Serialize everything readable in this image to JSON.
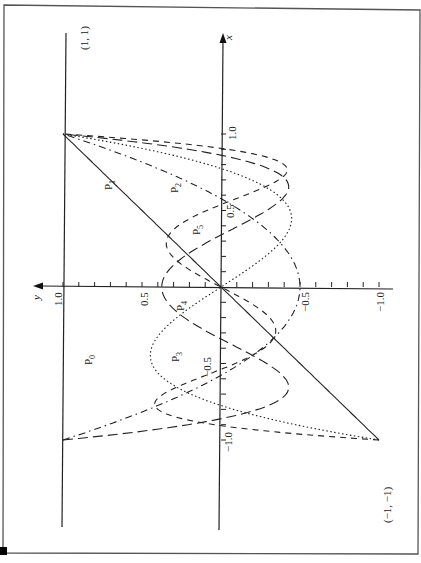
{
  "chart_data": {
    "type": "line",
    "title": "",
    "orientation": "rotated 90 degrees counter-clockwise (x axis points up, y axis points left)",
    "xlabel": "x",
    "ylabel": "y",
    "xlim": [
      -1.0,
      1.0
    ],
    "ylim": [
      -1.0,
      1.0
    ],
    "x_tick_labels": [
      "1.0",
      "0.5",
      "-0.5",
      "-1.0"
    ],
    "y_tick_labels": [
      "1.0",
      "0.5",
      "-0.5",
      "-1.0"
    ],
    "x_ticks": [
      -1.0,
      -0.9,
      -0.8,
      -0.7,
      -0.6,
      -0.5,
      -0.4,
      -0.3,
      -0.2,
      -0.1,
      0.1,
      0.2,
      0.3,
      0.4,
      0.5,
      0.6,
      0.7,
      0.8,
      0.9,
      1.0
    ],
    "y_ticks": [
      -1.0,
      -0.9,
      -0.8,
      -0.7,
      -0.6,
      -0.5,
      -0.4,
      -0.3,
      -0.2,
      -0.1,
      0.1,
      0.2,
      0.3,
      0.4,
      0.5,
      0.6,
      0.7,
      0.8,
      0.9,
      1.0
    ],
    "grid": false,
    "legend": "inline labels",
    "annotations": [
      "(1, 1)",
      "(-1, -1)"
    ],
    "series": [
      {
        "name": "P0",
        "label": "P",
        "sub": "0",
        "formula": "1",
        "style": "solid",
        "x": [
          -1,
          -0.5,
          0,
          0.5,
          1
        ],
        "values": [
          1,
          1,
          1,
          1,
          1
        ]
      },
      {
        "name": "P1",
        "label": "P",
        "sub": "1",
        "formula": "x",
        "style": "solid",
        "x": [
          -1,
          -0.5,
          0,
          0.5,
          1
        ],
        "values": [
          -1,
          -0.5,
          0,
          0.5,
          1
        ]
      },
      {
        "name": "P2",
        "label": "P",
        "sub": "2",
        "formula": "(3x^2-1)/2",
        "style": "dash-dot",
        "x": [
          -1,
          -0.5,
          0,
          0.5,
          1
        ],
        "values": [
          1,
          -0.125,
          -0.5,
          -0.125,
          1
        ]
      },
      {
        "name": "P3",
        "label": "P",
        "sub": "3",
        "formula": "(5x^3-3x)/2",
        "style": "dotted",
        "x": [
          -1,
          -0.5,
          0,
          0.5,
          1
        ],
        "values": [
          -1,
          0.4375,
          0,
          -0.4375,
          1
        ]
      },
      {
        "name": "P4",
        "label": "P",
        "sub": "4",
        "formula": "(35x^4-30x^2+3)/8",
        "style": "long-dash",
        "x": [
          -1,
          -0.5,
          0,
          0.5,
          1
        ],
        "values": [
          1,
          -0.2891,
          0.375,
          -0.2891,
          1
        ]
      },
      {
        "name": "P5",
        "label": "P",
        "sub": "5",
        "formula": "(63x^5-70x^3+15x)/8",
        "style": "short-dash",
        "x": [
          -1,
          -0.5,
          0,
          0.5,
          1
        ],
        "values": [
          -1,
          -0.0898,
          0,
          0.0898,
          1
        ]
      }
    ]
  },
  "labels": {
    "x_axis": "x",
    "y_axis": "y",
    "point_top": "(1, 1)",
    "point_bottom": "(−1, −1)",
    "x_tick_1": "1.0",
    "x_tick_05": "0.5",
    "x_tick_m05": "−0.5",
    "x_tick_m1": "−1.0",
    "y_tick_1": "1.0",
    "y_tick_05": "0.5",
    "y_tick_m05": "−0.5",
    "y_tick_m1": "−1.0",
    "p0": "P",
    "p0_sub": "0",
    "p1": "P",
    "p1_sub": "1",
    "p2": "P",
    "p2_sub": "2",
    "p3a": "P",
    "p3a_sub": "3",
    "p3b": "P",
    "p3b_sub": "3",
    "p4": "P",
    "p4_sub": "4",
    "p5": "P",
    "p5_sub": "5"
  }
}
